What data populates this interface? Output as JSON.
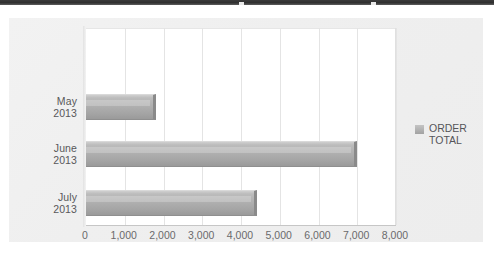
{
  "chart_data": {
    "type": "bar",
    "orientation": "horizontal",
    "title": "",
    "xlabel": "",
    "ylabel": "",
    "categories": [
      "May\n2013",
      "June\n2013",
      "July\n2013"
    ],
    "category_labels": [
      "May 2013",
      "June 2013",
      "July 2013"
    ],
    "series": [
      {
        "name": "ORDER\nTOTAL",
        "values": [
          1800,
          7000,
          4400
        ]
      }
    ],
    "xlim": [
      0,
      8000
    ],
    "x_ticks": [
      0,
      1000,
      2000,
      3000,
      4000,
      5000,
      6000,
      7000,
      8000
    ],
    "x_tick_labels": [
      "0",
      "1,000",
      "2,000",
      "3,000",
      "4,000",
      "5,000",
      "6,000",
      "7,000",
      "8,000"
    ],
    "grid": true,
    "grid_axis": "x",
    "legend": {
      "position": "right",
      "entries": [
        {
          "label": "ORDER\nTOTAL",
          "color": "#a8a8a8"
        }
      ]
    },
    "colors": {
      "bar_fill": "#a8a8a8",
      "bar_edge": "#8a8a8a",
      "plot_background": "#ffffff",
      "panel_background": "#efefef",
      "gridline": "#e4e4e4",
      "axis": "#b9b9b9",
      "text": "#58585a"
    }
  },
  "legend": {
    "series_label": "ORDER\nTOTAL"
  },
  "axis": {
    "categories": [
      {
        "line1": "May",
        "line2": "2013"
      },
      {
        "line1": "June",
        "line2": "2013"
      },
      {
        "line1": "July",
        "line2": "2013"
      }
    ],
    "x_tick_labels": [
      "0",
      "1,000",
      "2,000",
      "3,000",
      "4,000",
      "5,000",
      "6,000",
      "7,000",
      "8,000"
    ]
  }
}
